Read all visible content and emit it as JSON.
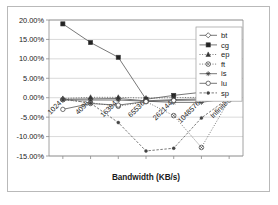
{
  "chart_data": {
    "type": "line",
    "title": "",
    "xlabel": "Bandwidth (KB/s)",
    "ylabel": "",
    "categories": [
      "1024",
      "4096",
      "16384",
      "65536",
      "262144",
      "1048576",
      "Infinite"
    ],
    "ytick_labels": [
      "20.00%",
      "15.00%",
      "10.00%",
      "5.00%",
      "0.00%",
      "-5.00%",
      "-10.00%",
      "-15.00%"
    ],
    "ytick_values": [
      20,
      15,
      10,
      5,
      0,
      -5,
      -10,
      -15
    ],
    "ylim": [
      -15,
      20
    ],
    "grid": true,
    "legend_position": "top-right",
    "value_suffix": "%",
    "series": [
      {
        "name": "bt",
        "marker": "open-diamond",
        "line": "solid",
        "values": [
          -0.4,
          -0.3,
          -0.2,
          -0.8,
          -0.5,
          -0.3,
          0.2
        ]
      },
      {
        "name": "cg",
        "marker": "filled-square",
        "line": "solid",
        "values": [
          19.0,
          14.2,
          10.4,
          -0.4,
          0.6,
          1.4,
          0.4
        ]
      },
      {
        "name": "ep",
        "marker": "filled-triangle",
        "line": "dotted",
        "values": [
          -0.2,
          0.1,
          0.1,
          -0.1,
          0.0,
          0.1,
          0.1
        ]
      },
      {
        "name": "ft",
        "marker": "open-circle-x",
        "line": "dotted",
        "values": [
          -0.5,
          -1.3,
          -2.2,
          -1.0,
          -4.6,
          -12.8,
          -0.6
        ]
      },
      {
        "name": "is",
        "marker": "star",
        "line": "solid",
        "values": [
          -0.6,
          -0.6,
          -0.6,
          -0.9,
          -1.2,
          -1.2,
          -0.1
        ]
      },
      {
        "name": "lu",
        "marker": "open-circle",
        "line": "solid",
        "values": [
          -3.0,
          -1.5,
          -1.9,
          -1.0,
          -0.7,
          -0.6,
          0.1
        ]
      },
      {
        "name": "sp",
        "marker": "filled-dot",
        "line": "dashed",
        "values": [
          -0.3,
          -1.4,
          -6.4,
          -13.7,
          -13.0,
          -5.2,
          0.0
        ]
      }
    ]
  }
}
